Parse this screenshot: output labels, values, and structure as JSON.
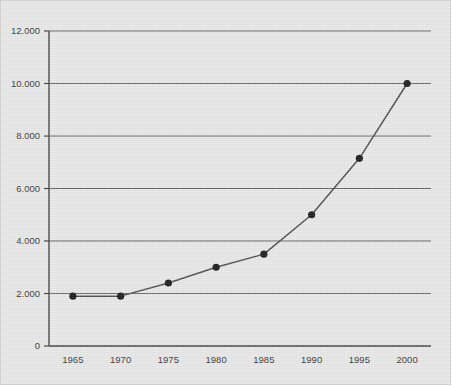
{
  "chart_data": {
    "type": "line",
    "title": "",
    "subtitle": "",
    "xlabel": "",
    "ylabel": "",
    "categories": [
      "1965",
      "1970",
      "1975",
      "1980",
      "1985",
      "1990",
      "1995",
      "2000"
    ],
    "x": [
      1965,
      1970,
      1975,
      1980,
      1985,
      1990,
      1995,
      2000
    ],
    "values": [
      1900,
      1900,
      2400,
      3000,
      3500,
      5000,
      7150,
      10000
    ],
    "series": [
      {
        "name": "",
        "values": [
          1900,
          1900,
          2400,
          3000,
          3500,
          5000,
          7150,
          10000
        ]
      }
    ],
    "xlim": [
      1962.5,
      2002.5
    ],
    "ylim": [
      0,
      12000
    ],
    "ytick_values": [
      0,
      2000,
      4000,
      6000,
      8000,
      10000,
      12000
    ],
    "ytick_labels": [
      "0",
      "2.000",
      "4.000",
      "6.000",
      "8.000",
      "10.000",
      "12.000"
    ],
    "xtick_labels": [
      "1965",
      "1970",
      "1975",
      "1980",
      "1985",
      "1990",
      "1995",
      "2000"
    ],
    "grid": "horizontal",
    "legend": "none",
    "marker": "filled-circle",
    "line_color": "#3a3a3a",
    "marker_color": "#000000",
    "grid_color": "#555555",
    "axis_color": "#2a2a2a",
    "background_color": "#e6e6e6",
    "annotations": []
  }
}
